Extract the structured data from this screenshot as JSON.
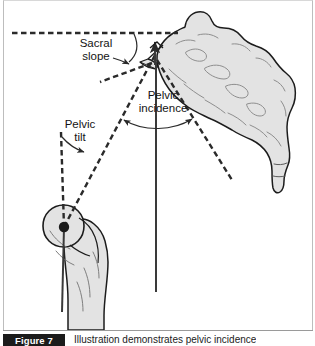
{
  "figure": {
    "number_label": "Figure 7",
    "caption": "Illustration demonstrates pelvic incidence",
    "background_color": "#ffffff",
    "bone_fill_color": "#e3e3e3",
    "bone_outline_color": "#1c1c1c",
    "dashed_line_color": "#2a2a2a",
    "solid_line_color": "#3a3a3a",
    "label_text_color": "#141414",
    "caption_box_color": "#1b1b1b"
  },
  "diagram": {
    "type": "medical-illustration",
    "labels": [
      {
        "id": "sacral-slope",
        "line1": "Sacral",
        "line2": "slope",
        "x": 96,
        "y1": 47,
        "y2": 60,
        "points_to": "angle between horizontal reference line and sacral endplate"
      },
      {
        "id": "pelvic-incidence",
        "line1": "Pelvic",
        "line2": "incidence",
        "x": 163,
        "y1": 99,
        "y2": 112,
        "points_to": "angle between sacral endplate perpendicular and hip axis line"
      },
      {
        "id": "pelvic-tilt",
        "line1": "Pelvic",
        "line2": "tilt",
        "x": 80,
        "y1": 128,
        "y2": 141,
        "points_to": "angle between vertical reference and hip-to-sacrum line"
      }
    ],
    "anatomy": [
      {
        "id": "sacrum",
        "description": "Sacrum and coccyx, sagittal view, upper right"
      },
      {
        "id": "femoral-head",
        "description": "Proximal femur with femoral head, lower left"
      },
      {
        "id": "hip-axis-point",
        "description": "Center of femoral head marked with filled dot",
        "x": 64,
        "y": 227
      }
    ],
    "reference_lines": [
      {
        "id": "horizontal-reference",
        "style": "dashed",
        "orientation": "horizontal",
        "y": 33
      },
      {
        "id": "vertical-reference",
        "style": "dashed",
        "orientation": "vertical",
        "x": 61
      },
      {
        "id": "sacral-endplate-line",
        "style": "dashed",
        "orientation": "oblique"
      },
      {
        "id": "hip-to-sacrum-line",
        "style": "dashed",
        "orientation": "oblique"
      },
      {
        "id": "endplate-perpendicular",
        "style": "solid",
        "orientation": "oblique-vertical"
      },
      {
        "id": "hip-axis-vertical",
        "style": "solid",
        "orientation": "vertical",
        "x": 156
      }
    ]
  }
}
